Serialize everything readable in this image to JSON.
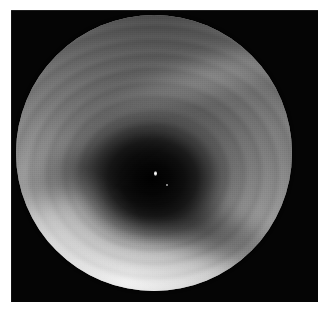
{
  "document": {
    "width": 325,
    "height": 309,
    "page_background": "#ffffff"
  },
  "figure": {
    "kind": "endoscopic-photograph",
    "modality_label": "Endoscopy",
    "description": "Grayscale endoscopic view of a tubular mucosal lumen with concentric folds converging on a dark central opening",
    "plate": {
      "background_color": "#050505",
      "left": 11,
      "top": 10,
      "width": 307,
      "height": 292
    },
    "field_of_view": {
      "shape": "circle",
      "center_x": 154,
      "center_y": 153,
      "diameter": 276,
      "rim_color": "#050505"
    },
    "lumen": {
      "center_x_pct": 49.5,
      "center_y_pct": 57.5,
      "darkest_color": "#000000",
      "label": "lumen-opening"
    },
    "specular_highlight": {
      "present": true,
      "color": "#ffffff"
    },
    "tonal_range": {
      "brightest": "#f2f2f2",
      "midtone": "#9a9a9a",
      "darkest": "#000000"
    },
    "features": [
      {
        "name": "fold-rings",
        "note": "concentric mucosal folds around lumen"
      },
      {
        "name": "fold-lower-right",
        "note": "dark longitudinal crease sweeping lower-right"
      },
      {
        "name": "fold-upper-left",
        "note": "dark crease toward upper-left"
      },
      {
        "name": "band-upper-right",
        "note": "pale illuminated band upper-right quadrant"
      },
      {
        "name": "bottom-glow",
        "note": "bright specular illumination pool at bottom"
      },
      {
        "name": "left-glow",
        "note": "bright pool lower-left"
      },
      {
        "name": "vignette",
        "note": "peripheral optical vignette at circular rim"
      }
    ],
    "caption": ""
  }
}
